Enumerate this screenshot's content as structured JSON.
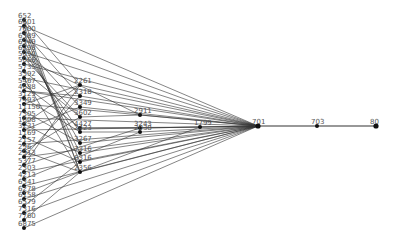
{
  "diagram": {
    "type": "network-graph",
    "edge_color": "#333333",
    "node_color": "#111111",
    "label_color": "#555555",
    "nodes": [
      {
        "id": "652",
        "label": "652",
        "x": 24,
        "y": 20
      },
      {
        "id": "6601",
        "label": "6601",
        "x": 24,
        "y": 26
      },
      {
        "id": "7600",
        "label": "7600",
        "x": 24,
        "y": 33
      },
      {
        "id": "6389",
        "label": "6389",
        "x": 24,
        "y": 40
      },
      {
        "id": "6949",
        "label": "6949",
        "x": 24,
        "y": 46
      },
      {
        "id": "6298",
        "label": "6298",
        "x": 24,
        "y": 52
      },
      {
        "id": "5050",
        "label": "5050",
        "x": 24,
        "y": 58
      },
      {
        "id": "5066",
        "label": "5066",
        "x": 24,
        "y": 64
      },
      {
        "id": "5735",
        "label": "5735",
        "x": 24,
        "y": 71
      },
      {
        "id": "3392",
        "label": "3392",
        "x": 24,
        "y": 78
      },
      {
        "id": "5467",
        "label": "5467",
        "x": 24,
        "y": 85
      },
      {
        "id": "4688",
        "label": "4688",
        "x": 24,
        "y": 91
      },
      {
        "id": "3129",
        "label": "3129",
        "x": 24,
        "y": 98
      },
      {
        "id": "7493",
        "label": "7493",
        "x": 24,
        "y": 104
      },
      {
        "id": "11150",
        "label": "11150",
        "x": 24,
        "y": 111
      },
      {
        "id": "7305",
        "label": "7305",
        "x": 24,
        "y": 118
      },
      {
        "id": "1608",
        "label": "1608",
        "x": 24,
        "y": 124
      },
      {
        "id": "3231",
        "label": "3231",
        "x": 24,
        "y": 130
      },
      {
        "id": "1169",
        "label": "1169",
        "x": 24,
        "y": 137
      },
      {
        "id": "2157",
        "label": "2157",
        "x": 24,
        "y": 144
      },
      {
        "id": "296",
        "label": "296",
        "x": 24,
        "y": 151
      },
      {
        "id": "2913",
        "label": "2913",
        "x": 24,
        "y": 157
      },
      {
        "id": "5377",
        "label": "5377",
        "x": 24,
        "y": 165
      },
      {
        "id": "2303",
        "label": "2303",
        "x": 24,
        "y": 172
      },
      {
        "id": "4213",
        "label": "4213",
        "x": 24,
        "y": 179
      },
      {
        "id": "6341",
        "label": "6341",
        "x": 24,
        "y": 186
      },
      {
        "id": "6278",
        "label": "6278",
        "x": 24,
        "y": 193
      },
      {
        "id": "6158",
        "label": "6158",
        "x": 24,
        "y": 199
      },
      {
        "id": "6579",
        "label": "6579",
        "x": 24,
        "y": 206
      },
      {
        "id": "7316",
        "label": "7316",
        "x": 24,
        "y": 213
      },
      {
        "id": "7760",
        "label": "7760",
        "x": 24,
        "y": 220
      },
      {
        "id": "6875",
        "label": "6875",
        "x": 24,
        "y": 228
      },
      {
        "id": "2261",
        "label": "2261",
        "x": 80,
        "y": 85
      },
      {
        "id": "2318",
        "label": "2318",
        "x": 80,
        "y": 96
      },
      {
        "id": "3349",
        "label": "3349",
        "x": 80,
        "y": 107
      },
      {
        "id": "3602",
        "label": "3602",
        "x": 80,
        "y": 117
      },
      {
        "id": "4427",
        "label": "4427",
        "x": 80,
        "y": 128
      },
      {
        "id": "2423",
        "label": "2423",
        "x": 80,
        "y": 132
      },
      {
        "id": "3267",
        "label": "3267",
        "x": 80,
        "y": 143
      },
      {
        "id": "7316b",
        "label": "7316",
        "x": 80,
        "y": 153
      },
      {
        "id": "6316",
        "label": "6316",
        "x": 80,
        "y": 162
      },
      {
        "id": "2356",
        "label": "2356",
        "x": 80,
        "y": 172
      },
      {
        "id": "2911",
        "label": "2911",
        "x": 140,
        "y": 115
      },
      {
        "id": "3243",
        "label": "3243",
        "x": 140,
        "y": 128
      },
      {
        "id": "2038",
        "label": "2038",
        "x": 140,
        "y": 132
      },
      {
        "id": "1799",
        "label": "1799",
        "x": 200,
        "y": 127
      },
      {
        "id": "701",
        "label": "701",
        "x": 258,
        "y": 126
      },
      {
        "id": "703",
        "label": "703",
        "x": 317,
        "y": 126
      },
      {
        "id": "80",
        "label": "80",
        "x": 376,
        "y": 126
      }
    ],
    "edges": [
      [
        "652",
        "2261"
      ],
      [
        "6601",
        "701"
      ],
      [
        "7600",
        "2318"
      ],
      [
        "6389",
        "701"
      ],
      [
        "6949",
        "3349"
      ],
      [
        "6298",
        "701"
      ],
      [
        "5050",
        "2911"
      ],
      [
        "5066",
        "701"
      ],
      [
        "5735",
        "3602"
      ],
      [
        "3392",
        "701"
      ],
      [
        "5467",
        "4427"
      ],
      [
        "4688",
        "701"
      ],
      [
        "3129",
        "2423"
      ],
      [
        "7493",
        "701"
      ],
      [
        "11150",
        "3267"
      ],
      [
        "7305",
        "701"
      ],
      [
        "1608",
        "7316b"
      ],
      [
        "3231",
        "701"
      ],
      [
        "1169",
        "6316"
      ],
      [
        "2157",
        "701"
      ],
      [
        "296",
        "2356"
      ],
      [
        "2913",
        "701"
      ],
      [
        "5377",
        "3243"
      ],
      [
        "2303",
        "701"
      ],
      [
        "4213",
        "2038"
      ],
      [
        "6341",
        "701"
      ],
      [
        "6278",
        "2356"
      ],
      [
        "6158",
        "701"
      ],
      [
        "6579",
        "6316"
      ],
      [
        "7316",
        "701"
      ],
      [
        "7760",
        "2356"
      ],
      [
        "6875",
        "701"
      ],
      [
        "6601",
        "2356"
      ],
      [
        "7600",
        "6316"
      ],
      [
        "6389",
        "7316b"
      ],
      [
        "6949",
        "3267"
      ],
      [
        "652",
        "2356"
      ],
      [
        "6298",
        "2423"
      ],
      [
        "5050",
        "3602"
      ],
      [
        "3392",
        "2356"
      ],
      [
        "4688",
        "2318"
      ],
      [
        "7493",
        "2261"
      ],
      [
        "1608",
        "2261"
      ],
      [
        "3231",
        "3349"
      ],
      [
        "296",
        "3602"
      ],
      [
        "2913",
        "2318"
      ],
      [
        "5377",
        "2261"
      ],
      [
        "2261",
        "701"
      ],
      [
        "2318",
        "701"
      ],
      [
        "3349",
        "701"
      ],
      [
        "3602",
        "2911"
      ],
      [
        "4427",
        "3243"
      ],
      [
        "2423",
        "2038"
      ],
      [
        "3267",
        "701"
      ],
      [
        "7316b",
        "701"
      ],
      [
        "6316",
        "701"
      ],
      [
        "2356",
        "701"
      ],
      [
        "2911",
        "701"
      ],
      [
        "3243",
        "701"
      ],
      [
        "2038",
        "701"
      ],
      [
        "1799",
        "701"
      ],
      [
        "2356",
        "1799"
      ],
      [
        "4427",
        "1799"
      ],
      [
        "701",
        "703"
      ],
      [
        "703",
        "80"
      ]
    ]
  }
}
